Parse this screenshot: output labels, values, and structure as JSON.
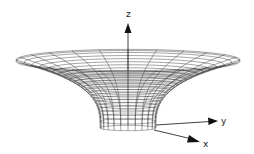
{
  "figure": {
    "colors": {
      "background": "#ffffff",
      "mesh": "#333333",
      "axis": "#111111"
    },
    "axes": {
      "z": {
        "label": "z"
      },
      "y": {
        "label": "y"
      },
      "x": {
        "label": "x"
      }
    },
    "mesh": {
      "radial_lines": 24,
      "rings": 22
    }
  }
}
